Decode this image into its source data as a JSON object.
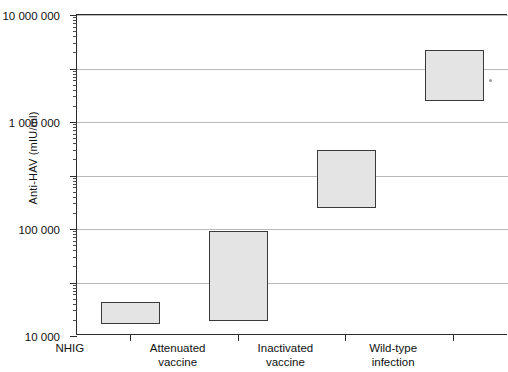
{
  "chart_data": {
    "type": "bar",
    "title": "",
    "xlabel": "",
    "ylabel": "Anti-HAV (mIU/ml)",
    "yscale": "log",
    "ylim": [
      10,
      10000000
    ],
    "grid": true,
    "legend": "none",
    "ytick_labels": [
      "10 000 000",
      "1 000 000",
      "100 000",
      "10 000",
      "1000",
      "100",
      "10"
    ],
    "ytick_values": [
      10000000,
      1000000,
      100000,
      10000,
      1000,
      100,
      10
    ],
    "categories": [
      "NHIG",
      "Attenuated vaccine",
      "Inactivated vaccine",
      "Wild-type infection"
    ],
    "category_lines": [
      [
        "NHIG"
      ],
      [
        "Attenuated",
        "vaccine"
      ],
      [
        "Inactivated",
        "vaccine"
      ],
      [
        "Wild-type",
        "infection"
      ]
    ],
    "series": [
      {
        "name": "Anti-HAV range",
        "ranges": [
          {
            "category": "NHIG",
            "low": 17,
            "high": 44
          },
          {
            "category": "Attenuated vaccine",
            "low": 19,
            "high": 900
          },
          {
            "category": "Inactivated vaccine",
            "low": 2500,
            "high": 30000
          },
          {
            "category": "Wild-type infection",
            "low": 250000,
            "high": 2200000
          }
        ]
      }
    ],
    "box_fill_color": "#e4e4e4",
    "box_edge_color": "#3a3a3a",
    "gridline_color": "#b9b9b9",
    "axis_color": "#2b2b2b"
  }
}
